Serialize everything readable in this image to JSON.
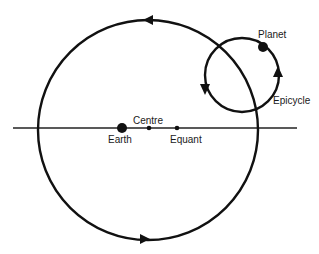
{
  "diagram": {
    "labels": {
      "planet": "Planet",
      "epicycle": "Epicycle",
      "earth": "Earth",
      "centre": "Centre",
      "equant": "Equant"
    },
    "colors": {
      "stroke": "#111111",
      "background": "#ffffff"
    }
  }
}
